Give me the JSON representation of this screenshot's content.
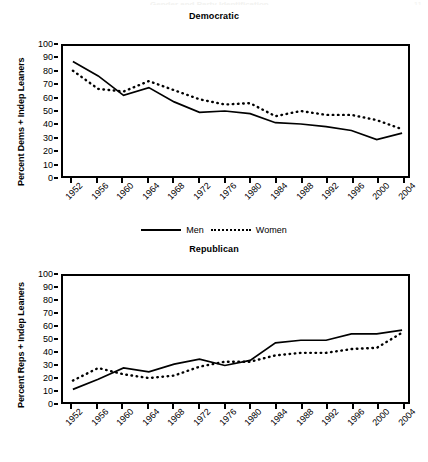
{
  "page": {
    "running_head": "Gender and Party Identification",
    "folio": "11"
  },
  "legend": {
    "men_label": "Men",
    "women_label": "Women"
  },
  "charts": [
    {
      "key": "democratic",
      "title": "Democratic",
      "ylabel": "Percent Dems + Indep Leaners"
    },
    {
      "key": "republican",
      "title": "Republican",
      "ylabel": "Percent Reps + Indep Leaners"
    }
  ],
  "chart_data": [
    {
      "type": "line",
      "title": "Democratic",
      "xlabel": "",
      "ylabel": "Percent Dems + Indep Leaners",
      "ylim": [
        0,
        100
      ],
      "ytick_step": 10,
      "yticks": [
        0,
        10,
        20,
        30,
        40,
        50,
        60,
        70,
        80,
        90,
        100
      ],
      "grid": false,
      "legend_position": "bottom",
      "categories": [
        1952,
        1956,
        1960,
        1964,
        1968,
        1972,
        1976,
        1980,
        1984,
        1988,
        1992,
        1996,
        2000,
        2004
      ],
      "series": [
        {
          "name": "Men",
          "style": "solid",
          "values": [
            88,
            77,
            62,
            68,
            57,
            49,
            50,
            48,
            41,
            40,
            38,
            35,
            28,
            33
          ]
        },
        {
          "name": "Women",
          "style": "dotted",
          "values": [
            81,
            67,
            65,
            73,
            66,
            59,
            55,
            56,
            46,
            50,
            47,
            47,
            43,
            36
          ]
        }
      ]
    },
    {
      "type": "line",
      "title": "Republican",
      "xlabel": "",
      "ylabel": "Percent Reps + Indep Leaners",
      "ylim": [
        0,
        100
      ],
      "ytick_step": 10,
      "yticks": [
        0,
        10,
        20,
        30,
        40,
        50,
        60,
        70,
        80,
        90,
        100
      ],
      "grid": false,
      "legend_position": "bottom",
      "categories": [
        1952,
        1956,
        1960,
        1964,
        1968,
        1972,
        1976,
        1980,
        1984,
        1988,
        1992,
        1996,
        2000,
        2004
      ],
      "series": [
        {
          "name": "Men",
          "style": "solid",
          "values": [
            10,
            18,
            27,
            24,
            30,
            34,
            29,
            33,
            47,
            49,
            49,
            54,
            54,
            57
          ]
        },
        {
          "name": "Women",
          "style": "dotted",
          "values": [
            17,
            27,
            22,
            19,
            21,
            28,
            32,
            32,
            37,
            39,
            39,
            42,
            43,
            55
          ]
        }
      ]
    }
  ]
}
